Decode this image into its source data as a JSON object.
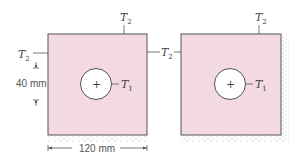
{
  "diagram": {
    "colors": {
      "fill": "#f3d9e2",
      "stroke": "#555555",
      "hole_fill": "#ffffff",
      "insulation": "#b8b8b8",
      "text": "#444444"
    },
    "left_panel": {
      "labels": {
        "top": {
          "sym": "T",
          "sub": "2"
        },
        "left": {
          "sym": "T",
          "sub": "2"
        },
        "right": {
          "sym": "T",
          "sub": "2"
        },
        "hole": {
          "sym": "T",
          "sub": "1"
        },
        "center_mark": "+"
      },
      "dimensions": {
        "vertical": "40 mm",
        "horizontal": "120 mm"
      },
      "insulated_edges": [
        "bottom"
      ]
    },
    "right_panel": {
      "labels": {
        "top": {
          "sym": "T",
          "sub": "2"
        },
        "left": {
          "sym": "T",
          "sub": "2"
        },
        "hole": {
          "sym": "T",
          "sub": "1"
        },
        "center_mark": "+"
      },
      "insulated_edges": [
        "bottom",
        "right"
      ]
    }
  }
}
